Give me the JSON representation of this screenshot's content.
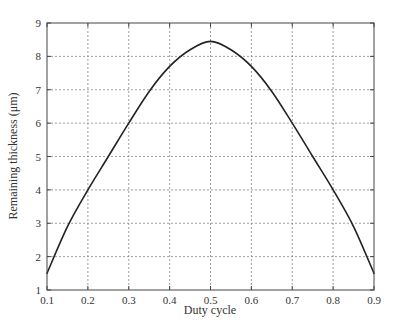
{
  "chart_data": {
    "type": "line",
    "title": "",
    "xlabel": "Duty cycle",
    "ylabel": "Remaining thickness (μm)",
    "xlim": [
      0.1,
      0.9
    ],
    "ylim": [
      1,
      9
    ],
    "xticks": [
      "0.1",
      "0.2",
      "0.3",
      "0.4",
      "0.5",
      "0.6",
      "0.7",
      "0.8",
      "0.9"
    ],
    "yticks": [
      "1",
      "2",
      "3",
      "4",
      "5",
      "6",
      "7",
      "8",
      "9"
    ],
    "grid": true,
    "legend": null,
    "series": [
      {
        "name": "Remaining thickness",
        "color": "#222222",
        "x": [
          0.1,
          0.15,
          0.2,
          0.25,
          0.3,
          0.35,
          0.4,
          0.45,
          0.5,
          0.55,
          0.6,
          0.65,
          0.7,
          0.75,
          0.8,
          0.85,
          0.9
        ],
        "y": [
          1.5,
          2.9,
          4.0,
          5.0,
          6.0,
          6.95,
          7.7,
          8.2,
          8.45,
          8.2,
          7.7,
          6.95,
          6.0,
          5.0,
          4.0,
          2.9,
          1.5
        ]
      }
    ]
  },
  "plot_area": {
    "left": 47,
    "top": 23,
    "right": 374,
    "bottom": 290
  },
  "colors": {
    "axis": "#444444",
    "grid": "#888888",
    "line": "#222222"
  }
}
